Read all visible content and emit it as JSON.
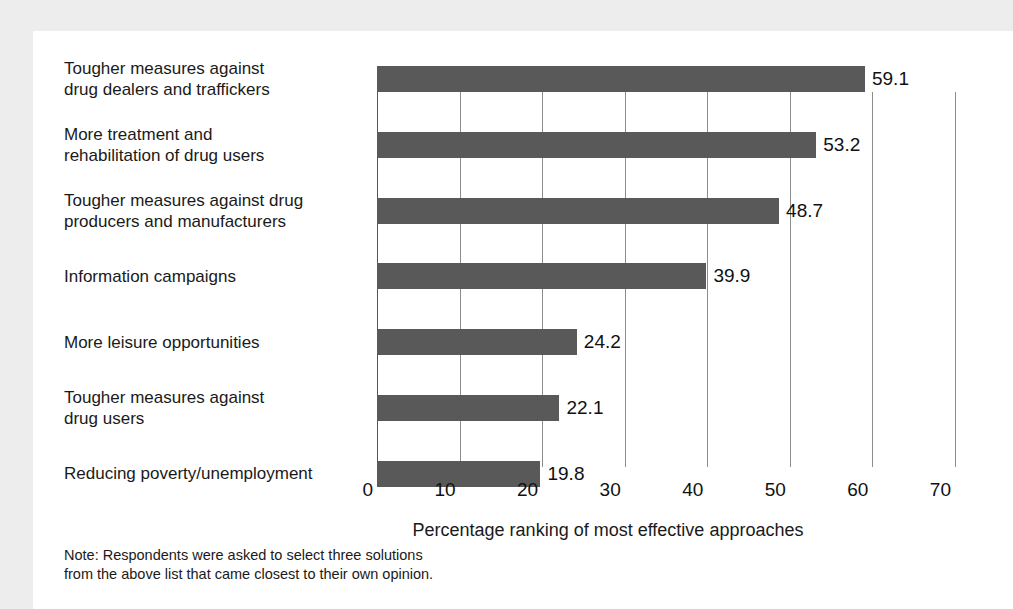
{
  "chart_data": {
    "type": "bar",
    "orientation": "horizontal",
    "title": "",
    "xlabel": "Percentage ranking of most effective approaches",
    "ylabel": "",
    "xlim": [
      0,
      70
    ],
    "xticks": [
      0,
      10,
      20,
      30,
      40,
      50,
      60,
      70
    ],
    "xtick_labels": [
      "0",
      "10",
      "20",
      "30",
      "40",
      "50",
      "60",
      "70"
    ],
    "grid": true,
    "legend": false,
    "bar_color": "#595959",
    "categories": [
      "Tougher measures against\ndrug dealers and traffickers",
      "More treatment and\nrehabilitation of drug users",
      "Tougher measures against drug\nproducers and manufacturers",
      "Information campaigns",
      "More leisure opportunities",
      "Tougher measures against\ndrug users",
      "Reducing poverty/unemployment"
    ],
    "values": [
      59.1,
      53.2,
      48.7,
      39.9,
      24.2,
      22.1,
      19.8
    ],
    "value_labels": [
      "59.1",
      "53.2",
      "48.7",
      "39.9",
      "24.2",
      "22.1",
      "19.8"
    ],
    "note": "Note: Respondents were asked to select three solutions\nfrom the above list that came closest to their own opinion."
  }
}
